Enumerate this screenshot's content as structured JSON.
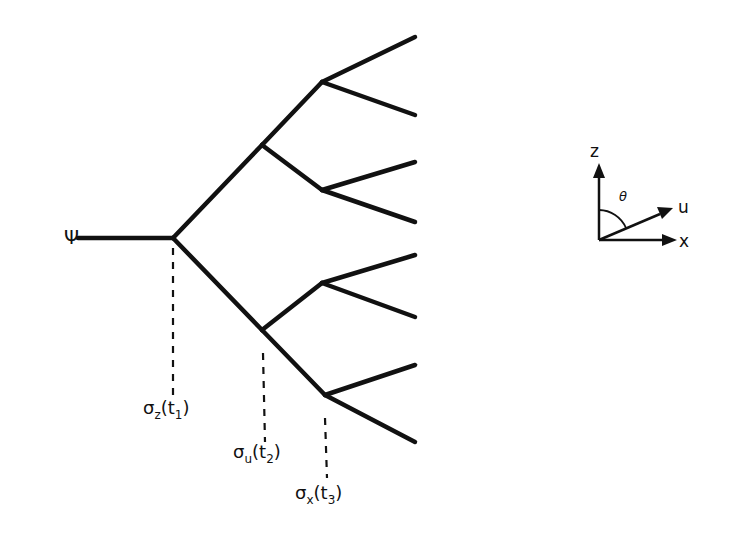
{
  "diagram": {
    "type": "binary-branching-tree",
    "root_label": "Ψ",
    "measurements": [
      {
        "label": "σ",
        "subscript_axis": "z",
        "time": "t",
        "time_index": "1"
      },
      {
        "label": "σ",
        "subscript_axis": "u",
        "time": "t",
        "time_index": "2"
      },
      {
        "label": "σ",
        "subscript_axis": "x",
        "time": "t",
        "time_index": "3"
      }
    ],
    "levels": 3,
    "leaf_count": 8
  },
  "axes_legend": {
    "z_label": "z",
    "u_label": "u",
    "x_label": "x",
    "angle_label": "θ"
  },
  "colors": {
    "line": "#111111",
    "background": "#ffffff"
  }
}
